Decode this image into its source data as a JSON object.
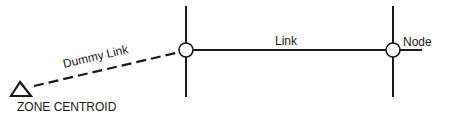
{
  "diagram": {
    "type": "network-schematic",
    "labels": {
      "dummy_link": "Dummy Link",
      "link": "Link",
      "node": "Node",
      "zone_centroid": "ZONE CENTROID"
    },
    "elements": {
      "zone_centroid": {
        "shape": "triangle",
        "x": 22,
        "y": 89
      },
      "left_node": {
        "shape": "circle",
        "x": 186,
        "y": 50
      },
      "right_node": {
        "shape": "circle",
        "x": 393,
        "y": 50
      },
      "dummy_link": {
        "style": "dashed",
        "from": "zone_centroid",
        "to": "left_node"
      },
      "link": {
        "style": "solid",
        "from": "left_node",
        "to": "right_node"
      }
    },
    "colors": {
      "stroke": "#1a1a1a",
      "background": "#ffffff"
    }
  }
}
